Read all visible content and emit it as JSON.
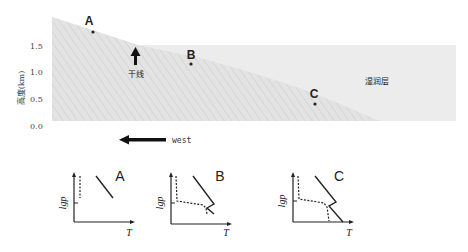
{
  "cross_section": {
    "y_axis_label": "高度(km)",
    "y_ticks": [
      "1.5",
      "1.0",
      "0.5",
      "0.0"
    ],
    "points": [
      {
        "id": "A",
        "label": "A"
      },
      {
        "id": "B",
        "label": "B"
      },
      {
        "id": "C",
        "label": "C"
      }
    ],
    "dryline_label": "干线",
    "moist_layer_label": "湿润层",
    "direction_label": "west",
    "colors": {
      "dry_air": "#e6e6e6",
      "moist_air": "#ececec",
      "ink": "#222222"
    }
  },
  "soundings": [
    {
      "id": "A",
      "title": "A",
      "y_label": "lgp",
      "x_label": "T"
    },
    {
      "id": "B",
      "title": "B",
      "y_label": "lgp",
      "x_label": "T"
    },
    {
      "id": "C",
      "title": "C",
      "y_label": "lgp",
      "x_label": "T"
    }
  ]
}
